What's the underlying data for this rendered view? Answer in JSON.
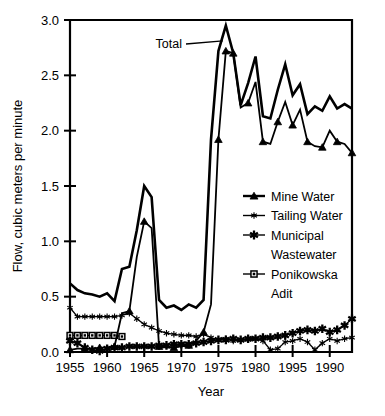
{
  "chart_data": {
    "type": "line",
    "title": "",
    "xlabel": "Year",
    "ylabel": "Flow, cubic meters per minute",
    "xlim": [
      1955,
      1993
    ],
    "ylim": [
      0.0,
      3.0
    ],
    "grid": false,
    "legend_position": "center-right inside plot area",
    "y_ticks": [
      "0.0",
      "0.5",
      "1.0",
      "1.5",
      "2.0",
      "2.5",
      "3.0"
    ],
    "y_tick_values": [
      0.0,
      0.5,
      1.0,
      1.5,
      2.0,
      2.5,
      3.0
    ],
    "x_ticks": [
      "1955",
      "1960",
      "1965",
      "1970",
      "1975",
      "1980",
      "1995",
      "1990"
    ],
    "x_tick_values": [
      1955,
      1960,
      1965,
      1970,
      1975,
      1980,
      1985,
      1990
    ],
    "annotations": [
      {
        "text": "Total",
        "points_to_year": 1976,
        "points_to_value": 2.82
      }
    ],
    "x": [
      1955,
      1956,
      1957,
      1958,
      1959,
      1960,
      1961,
      1962,
      1963,
      1964,
      1965,
      1966,
      1967,
      1968,
      1969,
      1970,
      1971,
      1972,
      1973,
      1974,
      1975,
      1976,
      1977,
      1978,
      1979,
      1980,
      1981,
      1982,
      1983,
      1984,
      1985,
      1986,
      1987,
      1988,
      1989,
      1990,
      1991,
      1992,
      1993
    ],
    "series": [
      {
        "name": "Total",
        "marker": "none",
        "line_width": 2.6,
        "values": [
          0.62,
          0.56,
          0.53,
          0.52,
          0.5,
          0.53,
          0.46,
          0.75,
          0.77,
          1.1,
          1.5,
          1.4,
          0.47,
          0.4,
          0.42,
          0.38,
          0.43,
          0.4,
          0.47,
          1.92,
          2.72,
          2.95,
          2.7,
          2.23,
          2.43,
          2.67,
          2.13,
          2.11,
          2.37,
          2.6,
          2.32,
          2.42,
          2.15,
          2.22,
          2.18,
          2.31,
          2.2,
          2.24,
          2.2
        ]
      },
      {
        "name": "Mine Water",
        "marker": "triangle",
        "line_width": 1.8,
        "values": [
          0.02,
          0.03,
          0.03,
          0.03,
          0.04,
          0.04,
          0.05,
          0.35,
          0.37,
          0.86,
          1.18,
          1.12,
          0.05,
          0.04,
          0.04,
          0.05,
          0.06,
          0.1,
          0.18,
          0.43,
          1.92,
          2.72,
          2.7,
          2.21,
          2.25,
          2.44,
          1.9,
          1.88,
          2.08,
          2.26,
          2.05,
          2.19,
          1.9,
          1.86,
          1.85,
          2.0,
          1.9,
          1.88,
          1.8
        ]
      },
      {
        "name": "Tailing Water",
        "marker": "star-thin",
        "line_width": 1.3,
        "values": [
          0.4,
          0.32,
          0.32,
          0.32,
          0.32,
          0.32,
          0.32,
          0.33,
          0.35,
          0.3,
          0.25,
          0.22,
          0.19,
          0.17,
          0.16,
          0.15,
          0.15,
          0.14,
          0.16,
          0.13,
          0.11,
          0.12,
          0.1,
          0.11,
          0.11,
          0.12,
          0.1,
          0.02,
          0.03,
          0.09,
          0.1,
          0.12,
          0.09,
          0.02,
          0.08,
          0.12,
          0.1,
          0.12,
          0.13
        ]
      },
      {
        "name": "Municipal Wastewater",
        "marker": "star-bold",
        "line_width": 1.3,
        "values": [
          0.1,
          0.08,
          0.04,
          0.02,
          0.01,
          0.03,
          0.04,
          0.04,
          0.05,
          0.05,
          0.05,
          0.05,
          0.06,
          0.06,
          0.07,
          0.07,
          0.07,
          0.08,
          0.09,
          0.1,
          0.11,
          0.11,
          0.12,
          0.11,
          0.12,
          0.12,
          0.13,
          0.13,
          0.14,
          0.15,
          0.17,
          0.19,
          0.2,
          0.19,
          0.21,
          0.18,
          0.2,
          0.24,
          0.3
        ]
      },
      {
        "name": "Ponikowska Adit",
        "marker": "square",
        "line_width": 1.4,
        "values": [
          0.15,
          0.15,
          0.15,
          0.15,
          0.15,
          0.15,
          0.15,
          0.14,
          null,
          null,
          null,
          null,
          null,
          null,
          null,
          null,
          null,
          null,
          null,
          null,
          null,
          null,
          null,
          null,
          null,
          null,
          null,
          null,
          null,
          null,
          null,
          null,
          null,
          null,
          null,
          null,
          null,
          null,
          null
        ]
      }
    ],
    "legend": [
      {
        "label": "Mine Water",
        "marker": "triangle"
      },
      {
        "label": "Tailing Water",
        "marker": "star-thin"
      },
      {
        "label": "Municipal",
        "label2": "Wastewater",
        "marker": "star-bold"
      },
      {
        "label": "Ponikowska",
        "label2": "Adit",
        "marker": "square"
      }
    ],
    "colors": {
      "foreground": "#000000",
      "background": "#ffffff"
    }
  }
}
